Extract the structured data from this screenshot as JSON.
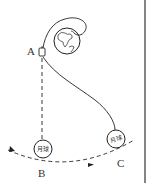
{
  "diagram": {
    "title": "",
    "labels": {
      "point_a": "A",
      "point_b": "B",
      "point_c": "C"
    },
    "moon_b_label": "月球",
    "moon_c_label": "月球",
    "colors": {
      "stroke": "#222222",
      "background": "#ffffff",
      "border": "#333333"
    },
    "elements": [
      "earth",
      "spacecraft",
      "dashed-descent-line",
      "moon-orbit-arc",
      "transfer-trajectory",
      "moon-at-b",
      "moon-at-c"
    ]
  }
}
